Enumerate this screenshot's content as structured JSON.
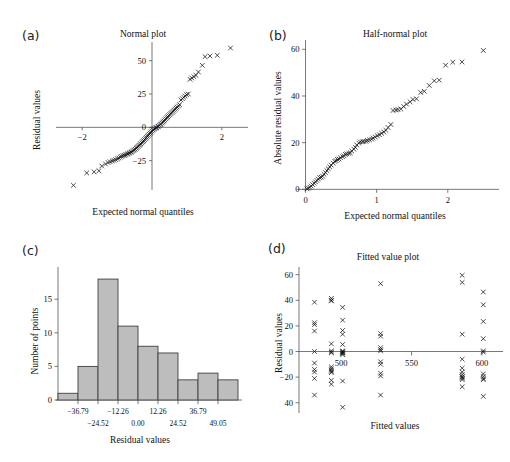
{
  "figure": {
    "background": "#ffffff",
    "marker_color": "#111111",
    "bar_fill": "#bdbdbd",
    "bar_stroke": "#3f3f3f",
    "axis_color": "#555555"
  },
  "panels": [
    {
      "tag": "(a)",
      "id": "panel-a"
    },
    {
      "tag": "(b)",
      "id": "panel-b"
    },
    {
      "tag": "(c)",
      "id": "panel-c"
    },
    {
      "tag": "(d)",
      "id": "panel-d"
    }
  ],
  "chart_data": [
    {
      "type": "scatter",
      "panel": "(a)",
      "title": "Normal plot",
      "xlabel": "Expected normal quantiles",
      "ylabel": "Residual values",
      "xlim": [
        -2.75,
        2.75
      ],
      "ylim": [
        -47,
        64
      ],
      "xticks": [
        -2,
        2
      ],
      "xticklabels": [
        "−2",
        "2"
      ],
      "yticks": [
        -25,
        0,
        25,
        50
      ],
      "yticklabels": [
        "−25",
        "0",
        "25",
        "50"
      ],
      "grid": false,
      "legend": "none",
      "marker": "x",
      "x": [
        -2.25,
        -1.87,
        -1.66,
        -1.52,
        -1.44,
        -1.33,
        -1.26,
        -1.2,
        -1.14,
        -1.09,
        -1.04,
        -0.99,
        -0.95,
        -0.91,
        -0.87,
        -0.83,
        -0.79,
        -0.76,
        -0.72,
        -0.69,
        -0.66,
        -0.63,
        -0.6,
        -0.57,
        -0.54,
        -0.51,
        -0.48,
        -0.45,
        -0.43,
        -0.4,
        -0.37,
        -0.34,
        -0.32,
        -0.29,
        -0.26,
        -0.24,
        -0.21,
        -0.18,
        -0.16,
        -0.13,
        -0.11,
        -0.08,
        -0.05,
        -0.03,
        0.0,
        0.03,
        0.05,
        0.08,
        0.11,
        0.13,
        0.16,
        0.18,
        0.21,
        0.24,
        0.26,
        0.29,
        0.32,
        0.34,
        0.37,
        0.4,
        0.43,
        0.45,
        0.48,
        0.51,
        0.54,
        0.57,
        0.6,
        0.63,
        0.66,
        0.69,
        0.72,
        0.76,
        0.79,
        0.83,
        0.87,
        0.91,
        0.95,
        0.99,
        1.04,
        1.09,
        1.14,
        1.2,
        1.26,
        1.33,
        1.44,
        1.52,
        1.66,
        1.87,
        2.25
      ],
      "y": [
        -43.5,
        -34.2,
        -33.4,
        -32.6,
        -29.0,
        -27.5,
        -26.4,
        -25.8,
        -25.2,
        -24.8,
        -24.2,
        -23.6,
        -23.0,
        -22.3,
        -21.8,
        -21.3,
        -21.0,
        -20.6,
        -20.2,
        -19.8,
        -19.4,
        -19.0,
        -18.6,
        -18.2,
        -17.5,
        -17.0,
        -16.5,
        -15.7,
        -15.0,
        -14.3,
        -13.6,
        -13.0,
        -12.3,
        -11.5,
        -10.8,
        -10.0,
        -9.2,
        -8.4,
        -7.6,
        -6.8,
        -6.0,
        -5.2,
        -4.4,
        -3.6,
        -2.8,
        -2.0,
        -1.4,
        -0.9,
        -0.5,
        -0.2,
        0.3,
        0.8,
        1.4,
        2.0,
        2.6,
        3.3,
        4.0,
        4.8,
        5.6,
        6.4,
        7.2,
        8.0,
        8.8,
        9.6,
        10.4,
        11.2,
        12.0,
        12.8,
        13.6,
        14.4,
        15.2,
        16.0,
        17.0,
        20.5,
        21.5,
        22.5,
        23.5,
        24.5,
        25.0,
        36.0,
        37.0,
        38.0,
        39.0,
        41.5,
        46.5,
        53.0,
        53.5,
        54.0,
        59.5
      ]
    },
    {
      "type": "scatter",
      "panel": "(b)",
      "title": "Half-normal plot",
      "xlabel": "Expected normal quantiles",
      "ylabel": "Absolute residual values",
      "xlim": [
        -0.12,
        2.72
      ],
      "ylim": [
        -2,
        64
      ],
      "xticks": [
        0,
        1,
        2
      ],
      "xticklabels": [
        "0",
        "1",
        "2"
      ],
      "yticks": [
        0,
        20,
        40,
        60
      ],
      "yticklabels": [
        "0",
        "20",
        "40",
        "60"
      ],
      "grid": false,
      "legend": "none",
      "marker": "x",
      "x": [
        0.02,
        0.04,
        0.06,
        0.08,
        0.1,
        0.12,
        0.14,
        0.16,
        0.18,
        0.2,
        0.22,
        0.24,
        0.26,
        0.28,
        0.3,
        0.32,
        0.34,
        0.36,
        0.39,
        0.41,
        0.43,
        0.45,
        0.47,
        0.49,
        0.52,
        0.54,
        0.56,
        0.58,
        0.61,
        0.63,
        0.65,
        0.68,
        0.7,
        0.72,
        0.75,
        0.77,
        0.8,
        0.82,
        0.85,
        0.87,
        0.9,
        0.93,
        0.95,
        0.98,
        1.01,
        1.04,
        1.07,
        1.1,
        1.13,
        1.16,
        1.2,
        1.23,
        1.27,
        1.3,
        1.34,
        1.38,
        1.42,
        1.47,
        1.51,
        1.56,
        1.62,
        1.67,
        1.74,
        1.81,
        1.88,
        1.97,
        2.07,
        2.2,
        2.5
      ],
      "y": [
        0.2,
        0.5,
        0.9,
        1.4,
        2.0,
        2.6,
        3.2,
        3.8,
        4.4,
        5.0,
        5.2,
        5.6,
        6.4,
        7.2,
        8.0,
        8.8,
        9.6,
        10.4,
        11.2,
        12.0,
        12.3,
        12.8,
        13.0,
        13.6,
        14.0,
        14.4,
        15.0,
        15.2,
        15.4,
        15.6,
        16.4,
        17.2,
        18.0,
        19.0,
        19.8,
        20.3,
        20.4,
        20.5,
        20.6,
        21.0,
        21.2,
        21.5,
        22.0,
        22.4,
        23.0,
        23.4,
        24.0,
        24.6,
        25.3,
        26.5,
        27.8,
        33.8,
        34.0,
        34.2,
        34.4,
        35.5,
        36.5,
        37.5,
        38.5,
        38.8,
        41.5,
        42.0,
        44.5,
        46.5,
        46.8,
        53.2,
        54.5,
        54.6,
        59.5
      ]
    },
    {
      "type": "bar",
      "panel": "(c)",
      "title": "",
      "xlabel": "Residual values",
      "ylabel": "Number of points",
      "categories": [
        "-36.79",
        "-24.52",
        "-12.26",
        "0.00",
        "12.26",
        "24.52",
        "36.79",
        "49.05",
        "61.31"
      ],
      "values": [
        1,
        5,
        18,
        11,
        8,
        7,
        3,
        4,
        3
      ],
      "bin_edges": [
        -49.05,
        -36.79,
        -24.52,
        -12.26,
        0.0,
        12.26,
        24.52,
        36.79,
        49.05,
        61.31
      ],
      "xtick_labels_upper": [
        "−36.79",
        "−12.26",
        "12.26",
        "36.79"
      ],
      "xtick_labels_lower": [
        "−24.52",
        "0.00",
        "24.52",
        "49.05"
      ],
      "yticks": [
        0,
        5,
        10,
        15
      ],
      "yticklabels": [
        "0",
        "5",
        "10",
        "15"
      ],
      "ylim": [
        0,
        19.5
      ],
      "grid": false,
      "legend": "none"
    },
    {
      "type": "scatter",
      "panel": "(d)",
      "title": "Fitted value plot",
      "xlabel": "Fitted values",
      "ylabel": "Residual values",
      "xlim": [
        470,
        615
      ],
      "ylim": [
        -48,
        66
      ],
      "xticks": [
        500,
        550,
        600
      ],
      "xticklabels": [
        "500",
        "550",
        "600"
      ],
      "yticks": [
        -40,
        -20,
        0,
        20,
        40,
        60
      ],
      "yticklabels": [
        "40",
        "−20",
        "0",
        "20",
        "40",
        "60"
      ],
      "grid": false,
      "legend": "none",
      "marker": "x",
      "x": [
        481,
        481,
        481,
        481,
        481,
        481,
        481,
        481,
        481,
        481,
        493,
        493,
        493,
        493,
        493,
        493,
        493,
        493,
        493,
        493,
        493,
        493,
        493,
        493,
        501,
        501,
        501,
        501,
        501,
        501,
        501,
        501,
        501,
        501,
        501,
        501,
        501,
        528,
        528,
        528,
        528,
        528,
        528,
        528,
        528,
        528,
        528,
        528,
        586,
        586,
        586,
        586,
        586,
        586,
        586,
        586,
        586,
        586,
        586,
        586,
        601,
        601,
        601,
        601,
        601,
        601,
        601,
        601,
        601,
        601,
        601
      ],
      "y": [
        38.5,
        22.5,
        21.0,
        16.0,
        0.0,
        -9.0,
        -14.0,
        -16.0,
        -21.0,
        -34.0,
        41.5,
        39.5,
        6.0,
        0.5,
        -0.5,
        -1.0,
        -12.0,
        -14.5,
        -15.5,
        -16.5,
        -22.5,
        -25.5,
        40.0,
        -13.5,
        34.5,
        24.5,
        16.5,
        13.5,
        5.5,
        0.5,
        -0.5,
        -1.5,
        -2.5,
        -23.0,
        -43.5,
        -1.0,
        0.0,
        53.0,
        14.0,
        12.0,
        3.0,
        1.5,
        0.5,
        -8.0,
        -10.0,
        -17.0,
        -19.0,
        -34.0,
        59.5,
        54.0,
        13.5,
        -6.0,
        -13.0,
        -16.0,
        -18.0,
        -20.0,
        -21.0,
        -22.0,
        -27.5,
        -19.5,
        46.5,
        36.5,
        23.5,
        10.0,
        0.5,
        -0.5,
        -17.5,
        -19.5,
        -21.0,
        -22.0,
        -35.0
      ]
    }
  ]
}
